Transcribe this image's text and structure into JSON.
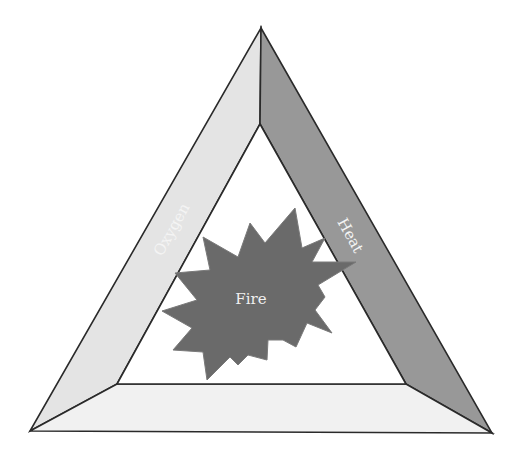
{
  "diagram": {
    "sides": {
      "left": {
        "label": "Oxygen",
        "color": "#e4e4e4"
      },
      "right": {
        "label": "Heat",
        "color": "#989898"
      },
      "bottom": {
        "label": "",
        "color": "#f1f1f1"
      }
    },
    "center": {
      "label": "Fire",
      "color": "#6a6a6a"
    },
    "stroke_color": "#2a2a2a",
    "background": "#ffffff"
  }
}
